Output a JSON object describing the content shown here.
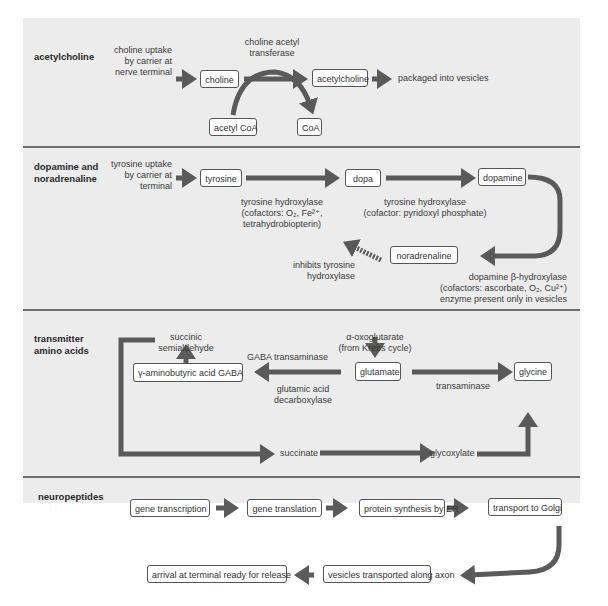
{
  "sections": {
    "acetylcholine": {
      "title": "acetylcholine",
      "uptake": [
        "choline uptake",
        "by carrier at",
        "nerve terminal"
      ],
      "boxes": {
        "choline": "choline",
        "acetylcholine": "acetylcholine",
        "acetyl_coa": "acetyl CoA",
        "coa": "CoA"
      },
      "enzyme": [
        "choline acetyl",
        "transferase"
      ],
      "result": "packaged into vesicles"
    },
    "dopamine": {
      "title": [
        "dopamine and",
        "noradrenaline"
      ],
      "uptake": [
        "tyrosine uptake",
        "by carrier at",
        "terminal"
      ],
      "boxes": {
        "tyrosine": "tyrosine",
        "dopa": "dopa",
        "dopamine": "dopamine",
        "noradrenaline": "noradrenaline"
      },
      "enzyme1": [
        "tyrosine hydroxylase",
        "(cofactors: O₂, Fe²⁺,",
        "tetrahydrobiopterin)"
      ],
      "enzyme2": [
        "tyrosine hydroxylase",
        "(cofactor: pyridoxyl phosphate)"
      ],
      "inhibit": [
        "inhibits tyrosine",
        "hydroxylase"
      ],
      "enzyme3": [
        "dopamine β-hydroxylase",
        "(cofactors: ascorbate, O₂, Cu²⁺)",
        "enzyme present only in vesicles"
      ]
    },
    "amino_acids": {
      "title": [
        "transmitter",
        "amino acids"
      ],
      "boxes": {
        "gaba": "γ-aminobutyric acid GABA",
        "glutamate": "glutamate",
        "glycine": "glycine"
      },
      "succinic": [
        "succinic",
        "semialdehyde"
      ],
      "oxoglutarate": [
        "α-oxoglutarate",
        "(from Krebs cycle)"
      ],
      "gaba_transaminase": "GABA transaminase",
      "decarboxylase": [
        "glutamic acid",
        "decarboxylase"
      ],
      "transaminase": "transaminase",
      "succinate": "succinate",
      "glycoxylate": "glycoxylate"
    },
    "neuropeptides": {
      "title": "neuropeptides",
      "steps": [
        "gene transcription",
        "gene translation",
        "protein synthesis by ER",
        "transport to Golgi",
        "vesicles transported along axon",
        "arrival at terminal ready for release"
      ]
    }
  },
  "colors": {
    "panel": "#ececec",
    "arrow": "#5a5a5a",
    "divider": "#6e6e6e"
  }
}
